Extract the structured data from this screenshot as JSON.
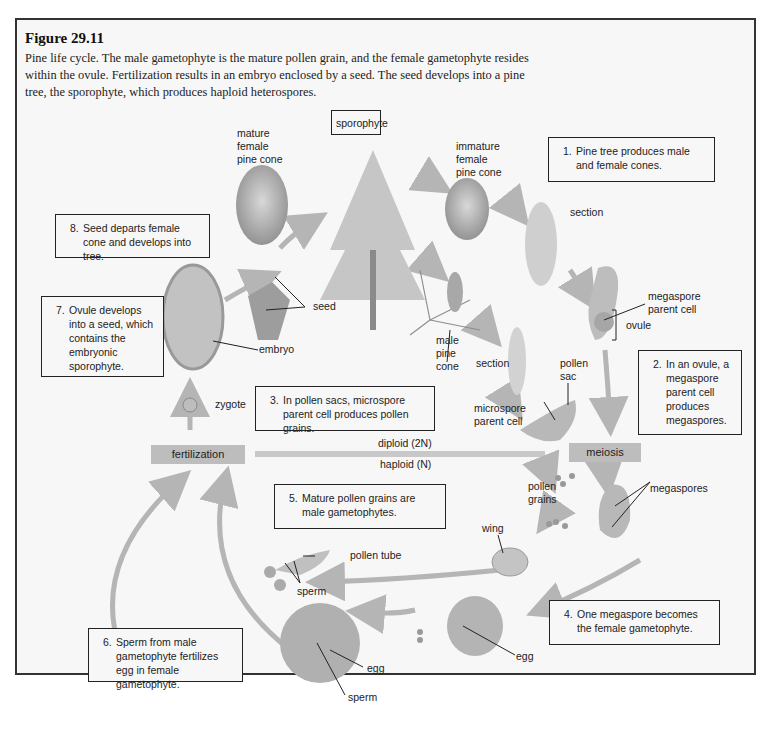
{
  "figure": {
    "title": "Figure 29.11",
    "caption": "Pine life cycle. The male gametophyte is the mature pollen grain, and the female gametophyte resides within the ovule. Fertilization results in an embryo enclosed by a seed. The seed develops into a pine tree, the sporophyte, which produces haploid heterospores."
  },
  "steps": [
    {
      "num": "1.",
      "text": "Pine tree produces male and female cones."
    },
    {
      "num": "2.",
      "text": "In an ovule, a megaspore parent cell produces megaspores."
    },
    {
      "num": "3.",
      "text": "In pollen sacs, microspore parent cell produces pollen grains."
    },
    {
      "num": "4.",
      "text": "One megaspore becomes the female gametophyte."
    },
    {
      "num": "5.",
      "text": "Mature pollen grains are male gametophytes."
    },
    {
      "num": "6.",
      "text": "Sperm from male gametophyte fertilizes egg in female gametophyte."
    },
    {
      "num": "7.",
      "text": "Ovule develops into a seed, which contains the embryonic sporophyte."
    },
    {
      "num": "8.",
      "text": "Seed departs female cone and develops into tree."
    }
  ],
  "sporophyte_label": "sporophyte",
  "phase_bar": {
    "left": "fertilization",
    "right": "meiosis",
    "above": "diploid (2N)",
    "below": "haploid (N)"
  },
  "labels": {
    "mature_female_cone": "mature female pine cone",
    "immature_female_cone": "immature female pine cone",
    "section_female": "section",
    "megaspore_parent_cell": "megaspore parent cell",
    "ovule": "ovule",
    "male_cone": "male pine cone",
    "section_male": "section",
    "pollen_sac": "pollen sac",
    "microspore_parent_cell": "microspore parent cell",
    "seed": "seed",
    "embryo": "embryo",
    "zygote": "zygote",
    "pollen_grains": "pollen grains",
    "megaspores": "megaspores",
    "wing": "wing",
    "pollen_tube": "pollen tube",
    "sperm_tube": "sperm",
    "egg_right": "egg",
    "egg_left": "egg",
    "sperm_bottom": "sperm"
  },
  "colors": {
    "frame_border": "#333333",
    "background": "#f7f7f7",
    "bar": "#bdbdbd",
    "arrow": "#b5b5b5",
    "art": "#9a9a9a"
  }
}
